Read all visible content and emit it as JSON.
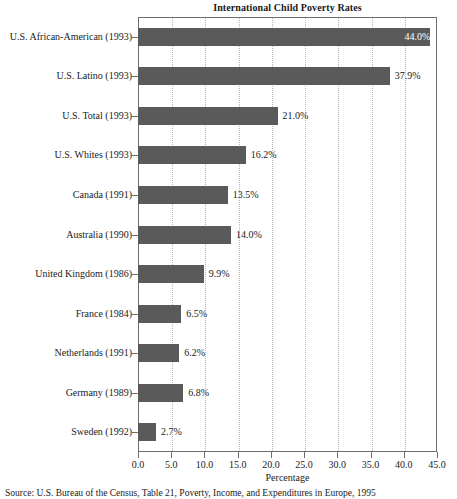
{
  "chart_data": {
    "type": "bar",
    "orientation": "horizontal",
    "title": "International Child Poverty Rates",
    "xlabel": "Percentage",
    "ylabel": "",
    "xlim": [
      0.0,
      45.0
    ],
    "xticks": [
      "0.0",
      "5.0",
      "10.0",
      "15.0",
      "20.0",
      "25.0",
      "30.0",
      "35.0",
      "40.0",
      "45.0"
    ],
    "xtick_values": [
      0,
      5,
      10,
      15,
      20,
      25,
      30,
      35,
      40,
      45
    ],
    "grid": "vertical-dotted",
    "legend": "none",
    "bar_color": "#5a5a5a",
    "categories": [
      "U.S. African-American (1993)",
      "U.S. Latino (1993)",
      "U.S. Total (1993)",
      "U.S. Whites (1993)",
      "Canada (1991)",
      "Australia (1990)",
      "United Kingdom (1986)",
      "France (1984)",
      "Netherlands (1991)",
      "Germany (1989)",
      "Sweden (1992)"
    ],
    "values": [
      44.0,
      37.9,
      21.0,
      16.2,
      13.5,
      14.0,
      9.9,
      6.5,
      6.2,
      6.8,
      2.7
    ],
    "data_labels": [
      "44.0%",
      "37.9%",
      "21.0%",
      "16.2%",
      "13.5%",
      "14.0%",
      "9.9%",
      "6.5%",
      "6.2%",
      "6.8%",
      "2.7%"
    ],
    "label_placement": [
      "inside",
      "outside",
      "outside",
      "outside",
      "outside",
      "outside",
      "outside",
      "outside",
      "outside",
      "outside",
      "outside"
    ]
  },
  "source": {
    "note": "Source: U.S. Bureau of the Census, Table 21, Poverty, Income, and Expenditures in Europe, 1995"
  }
}
